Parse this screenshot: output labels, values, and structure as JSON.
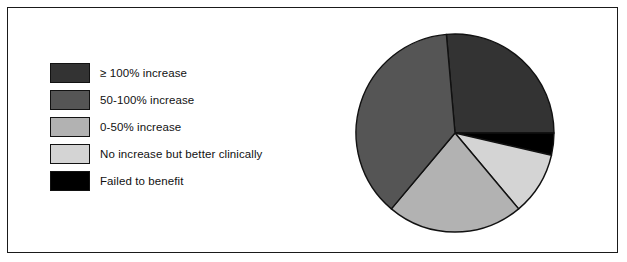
{
  "figure": {
    "background_color": "#ffffff",
    "border_color": "#1a1a1a"
  },
  "legend": {
    "items": [
      {
        "label": "≥ 100% increase",
        "color": "#333333"
      },
      {
        "label": "50-100% increase",
        "color": "#555555"
      },
      {
        "label": "0-50% increase",
        "color": "#b2b2b2"
      },
      {
        "label": "No increase but better clinically",
        "color": "#d4d4d4"
      },
      {
        "label": "Failed to benefit",
        "color": "#000000"
      }
    ]
  },
  "chart_data": {
    "type": "pie",
    "title": "",
    "xlabel": "",
    "ylabel": "",
    "legend_position": "left",
    "grid": false,
    "start_angle_deg": -5,
    "direction": "clockwise",
    "center": {
      "x": 107,
      "y": 107
    },
    "radius": 99,
    "stroke_color": "#111111",
    "categories": [
      "≥ 100% increase",
      "Failed to benefit",
      "No increase but better clinically",
      "0-50% increase",
      "50-100% increase"
    ],
    "values": [
      26.4,
      3.6,
      10.3,
      22.2,
      37.5
    ],
    "angles_deg": [
      95,
      13,
      37,
      80,
      135
    ],
    "colors": [
      "#333333",
      "#000000",
      "#d4d4d4",
      "#b2b2b2",
      "#555555"
    ],
    "slices": [
      {
        "label": "≥ 100% increase",
        "value": 26.4,
        "angle_deg": 95,
        "color": "#333333"
      },
      {
        "label": "Failed to benefit",
        "value": 3.6,
        "angle_deg": 13,
        "color": "#000000"
      },
      {
        "label": "No increase but better clinically",
        "value": 10.3,
        "angle_deg": 37,
        "color": "#d4d4d4"
      },
      {
        "label": "0-50% increase",
        "value": 22.2,
        "angle_deg": 80,
        "color": "#b2b2b2"
      },
      {
        "label": "50-100% increase",
        "value": 37.5,
        "angle_deg": 135,
        "color": "#555555"
      }
    ]
  }
}
